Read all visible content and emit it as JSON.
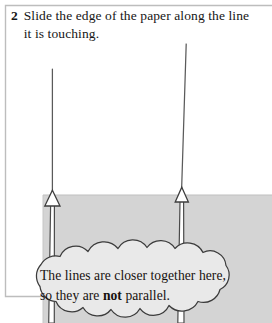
{
  "figure": {
    "kind": "instructional-diagram",
    "step": {
      "number": "2",
      "text": "Slide the edge of the paper along the line it is touching."
    },
    "callout": {
      "line1": "The lines are closer together here,",
      "line2_before": "so they are ",
      "line2_bold": "not",
      "line2_after": " parallel."
    },
    "colors": {
      "paper_fill": "#d4d4d4",
      "stroke": "#3a3a3a",
      "callout_fill": "#e9e9e9",
      "frame": "#b9b9b9",
      "text": "#161616"
    },
    "labels": {
      "paper": "shaded-paper-sheet",
      "left_line": "left-line",
      "right_line": "right-line",
      "left_arrow": "left-arrow",
      "right_arrow": "right-arrow",
      "callout_shape": "cloud-callout",
      "frame": "figure-frame"
    }
  }
}
